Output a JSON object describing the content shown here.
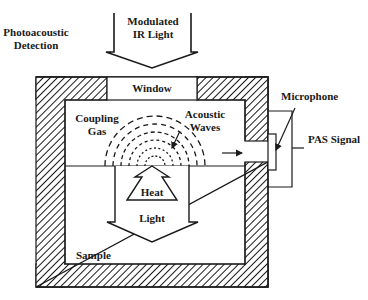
{
  "title": {
    "line1": "Photoacoustic",
    "line2": "Detection"
  },
  "incident_light": {
    "line1": "Modulated",
    "line2": "IR Light"
  },
  "cell": {
    "window_label": "Window",
    "coupling_gas_line1": "Coupling",
    "coupling_gas_line2": "Gas",
    "acoustic_waves_line1": "Acoustic",
    "acoustic_waves_line2": "Waves",
    "heat_label": "Heat",
    "light_label": "Light",
    "sample_label": "Sample"
  },
  "detector": {
    "microphone_label": "Microphone",
    "signal_label": "PAS Signal"
  },
  "colors": {
    "stroke": "#1a1a1a",
    "background": "#ffffff"
  }
}
